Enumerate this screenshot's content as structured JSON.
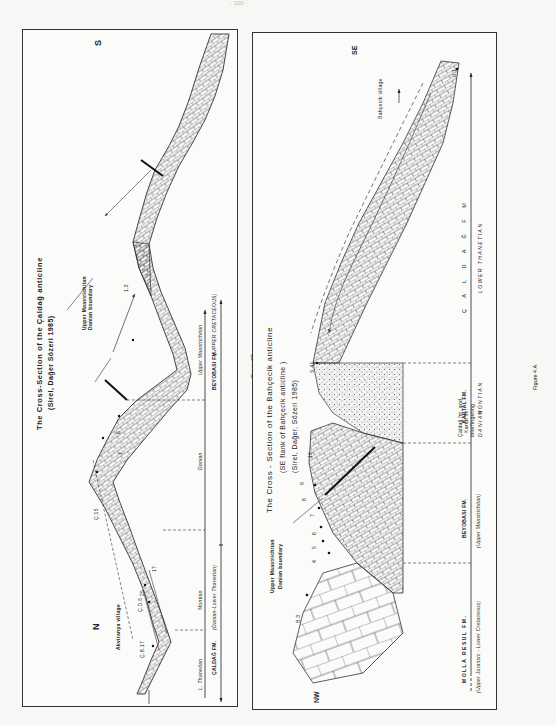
{
  "page": {
    "header_mark": "- 100 -"
  },
  "figure_3b": {
    "caption": "Figure 3B",
    "title": "The Cross-Section of the Çaldağ anticline",
    "subtitle": "(Sirel, Dağer Sözeri 1985)",
    "direction_left": "N",
    "direction_right": "S",
    "village_label": "Akviranya village",
    "boundary_label_line1": "Upper Maastrichtian",
    "boundary_label_line2": "Danian boundary",
    "sample_labels": [
      "Ç.B.17",
      "Ç.D.5",
      "25",
      "17",
      "18",
      "Ç.7",
      "2",
      "Ç.15",
      "3",
      "6",
      "8",
      "1",
      "2",
      "1.3"
    ],
    "stages": [
      "L. Thanetian",
      "Montian",
      "Danian",
      "Upper Maastrichtian"
    ],
    "formations": [
      "ÇALDAĞ FM. (Danian-Lower Thanetian)",
      "BEYOBASI FM (UPPER CRETACEOUS)"
    ],
    "formation_1": "ÇALDAĞ FM.",
    "formation_1_age": "(Danian-Lower Thanetian)",
    "formation_2": "BEYOBASI FM",
    "formation_2_age": "(UPPER CRETACEOUS)"
  },
  "figure_4a": {
    "caption": "Figure 4 A",
    "title": "The Cross - Section of the Bahçecik anticline",
    "subtitle_1": "(SE flank of Bahçecik anticline )",
    "subtitle_2": "(Sirel, Dağer, Sözeri 1985)",
    "direction_left": "NW",
    "direction_right": "SE",
    "village_label": "Bahçecik village",
    "boundary_label_line1": "Upper Maastrichtian",
    "boundary_label_line2": "Danian boundary",
    "sample_labels": [
      "B.3",
      "4",
      "5",
      "6",
      "7",
      "8",
      "9",
      "10",
      "S.41",
      "S.1"
    ],
    "units": [
      {
        "name": "MOLLA RESUL FM.",
        "age": "(Upper Jurassic - Lower Cretaceous)"
      },
      {
        "name": "BEYOBASI FM.",
        "age": "(Upper Maastrichtian)"
      },
      {
        "name": "Çaldağ fm. and Kartal fm. interfingering",
        "age": "DANIAN"
      },
      {
        "name": "KARTAL FM.",
        "age": "MONTIAN"
      },
      {
        "name": "Ç A L D A Ğ   F M",
        "age": "LOWER THANETIAN"
      }
    ],
    "interfinger_line1": "Çaldağ fm. and",
    "interfinger_line2": "Kartal fm.",
    "interfinger_line3": "interfingering"
  }
}
